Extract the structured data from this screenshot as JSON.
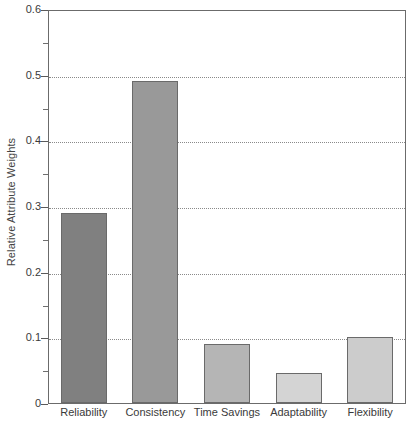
{
  "chart_data": {
    "type": "bar",
    "title": "",
    "xlabel": "",
    "ylabel": "Relative Attribute Weights",
    "categories": [
      "Reliability",
      "Consistency",
      "Time Savings",
      "Adaptability",
      "Flexibility"
    ],
    "values": [
      0.29,
      0.49,
      0.09,
      0.045,
      0.1
    ],
    "ylim": [
      0,
      0.6
    ],
    "ytick_labels": [
      "0",
      "0.1",
      "0.2",
      "0.3",
      "0.4",
      "0.5",
      "0.6"
    ],
    "ytick_values": [
      0,
      0.1,
      0.2,
      0.3,
      0.4,
      0.5,
      0.6
    ],
    "yminor_values": [
      0.05,
      0.15,
      0.25,
      0.35,
      0.45,
      0.55
    ],
    "grid": true,
    "grid_axis": "y",
    "grid_style": "dotted",
    "legend": "none",
    "bar_colors": [
      "#808080",
      "#999999",
      "#b5b5b5",
      "#d4d4d4",
      "#cccccc"
    ],
    "bar_edge_color": "#6a6a6a",
    "frame_color": "#6b6b6b",
    "grid_color": "#8a8a8a",
    "text_color": "#3a3a3a",
    "background": "#ffffff"
  }
}
